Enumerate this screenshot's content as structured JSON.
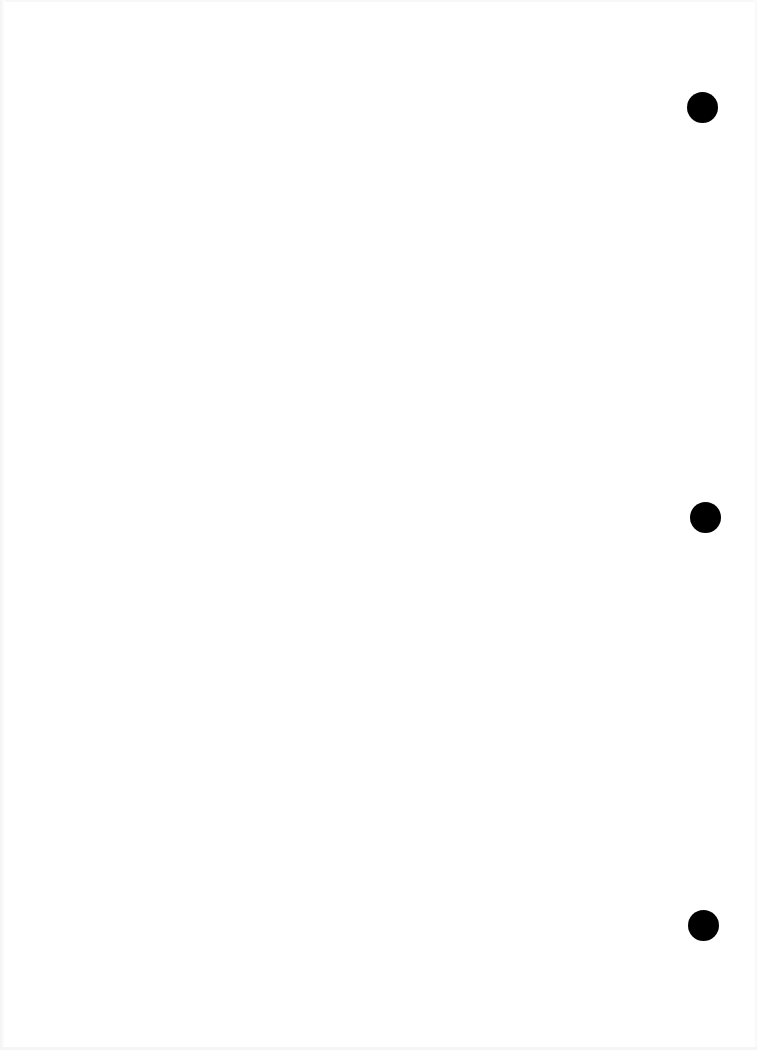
{
  "page": {
    "background": "#ffffff",
    "content_text": "",
    "punch_holes": [
      {
        "cx": 702,
        "cy": 107,
        "r": 15.5,
        "color": "#000000"
      },
      {
        "cx": 705,
        "cy": 517,
        "r": 15.5,
        "color": "#000000"
      },
      {
        "cx": 703,
        "cy": 925,
        "r": 15.5,
        "color": "#000000"
      }
    ]
  }
}
